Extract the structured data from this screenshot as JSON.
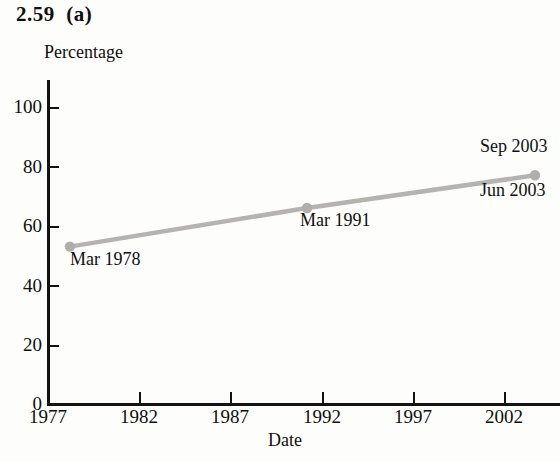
{
  "figure": {
    "label": "2.59  (a)"
  },
  "chart_data": {
    "type": "line",
    "title": "2.59  (a)",
    "xlabel": "Date",
    "ylabel": "Percentage",
    "xlim": [
      1977,
      2006
    ],
    "ylim": [
      0,
      100
    ],
    "grid": false,
    "legend": "none",
    "xticks": [
      "1977",
      "1982",
      "1987",
      "1992",
      "1997",
      "2002"
    ],
    "xtick_values": [
      1977,
      1982,
      1987,
      1992,
      1997,
      2002
    ],
    "yticks": [
      "0",
      "20",
      "40",
      "60",
      "80",
      "100"
    ],
    "ytick_values": [
      0,
      20,
      40,
      60,
      80,
      100
    ],
    "line_color": "#b5b3b0",
    "marker_color": "#b0aeab",
    "points": [
      {
        "label": "Mar 1978",
        "x": 1978.2,
        "y": 53,
        "label_pos": "below-right"
      },
      {
        "label": "Mar 1991",
        "x": 1991.2,
        "y": 66,
        "label_pos": "below-right"
      },
      {
        "label": "Sep 2003",
        "x": 2003.7,
        "y": 77,
        "label_pos": "above-right"
      },
      {
        "label": "Jun 2003",
        "x": 2003.7,
        "y": 77,
        "label_pos": "below-right"
      }
    ],
    "series": [
      {
        "name": "Percentage",
        "x": [
          1978.2,
          1991.2,
          2003.7
        ],
        "values": [
          53,
          66,
          77
        ]
      }
    ]
  },
  "annotations": {
    "mar1978": "Mar 1978",
    "mar1991": "Mar 1991",
    "sep2003": "Sep 2003",
    "jun2003": "Jun 2003"
  },
  "axes": {
    "y_title": "Percentage",
    "x_title": "Date",
    "y_labels": [
      "100",
      "80",
      "60",
      "40",
      "20",
      "0"
    ],
    "x_labels": [
      "1977",
      "1982",
      "1987",
      "1992",
      "1997",
      "2002"
    ]
  }
}
